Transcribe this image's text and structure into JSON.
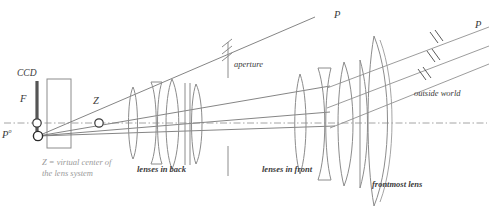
{
  "figure": {
    "type": "optical-ray-diagram",
    "background": "#ffffff",
    "stroke_color": "#8c8c8c",
    "dark_stroke": "#4a4a4a",
    "label_color": "#3a3a3a",
    "grey_label_color": "#9a9a9a"
  },
  "labels": {
    "ccd": "CCD",
    "focal_point": "F",
    "virtual_center": "Z",
    "principal_point": "P",
    "principal_point_sup": "o",
    "aperture": "aperture",
    "outside_world": "outside world",
    "lenses_in_back": "lenses in back",
    "lenses_in_front": "lenses in front",
    "frontmost_lens": "frontmost lens",
    "ray_point_mid": "P",
    "ray_point_right": "P",
    "legend_line1": "Z = virtual center of",
    "legend_line2": "the lens system"
  }
}
